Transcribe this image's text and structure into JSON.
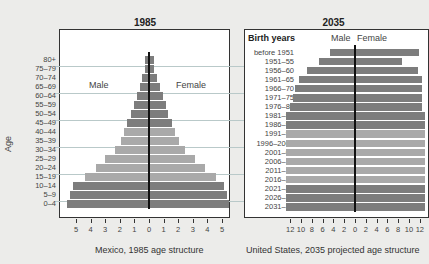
{
  "chart_data": [
    {
      "type": "bar",
      "orientation": "horizontal-population-pyramid",
      "title": "1985",
      "caption": "Mexico, 1985 age structure",
      "ylabel": "Age",
      "xlabel": "",
      "left_label": "Male",
      "right_label": "Female",
      "xlim": [
        -5.6,
        5.6
      ],
      "xticks": [
        5,
        4,
        3,
        2,
        1,
        0,
        1,
        2,
        3,
        4,
        5
      ],
      "categories": [
        "80+",
        "75–79",
        "70–74",
        "65–69",
        "60–64",
        "55–59",
        "50–54",
        "45–49",
        "40–44",
        "35–39",
        "30–34",
        "25–29",
        "20–24",
        "15–19",
        "10–14",
        "5–9",
        "0–4"
      ],
      "series": [
        {
          "name": "Male",
          "values": [
            0.3,
            0.3,
            0.5,
            0.6,
            0.8,
            1.0,
            1.2,
            1.5,
            1.7,
            1.9,
            2.3,
            3.0,
            3.6,
            4.4,
            5.2,
            5.4,
            5.6
          ]
        },
        {
          "name": "Female",
          "values": [
            0.3,
            0.3,
            0.5,
            0.7,
            0.9,
            1.1,
            1.2,
            1.5,
            1.7,
            2.0,
            2.4,
            3.1,
            3.8,
            4.5,
            5.1,
            5.3,
            5.4
          ]
        }
      ],
      "grid": true
    },
    {
      "type": "bar",
      "orientation": "horizontal-population-pyramid",
      "title": "2035",
      "caption": "United States, 2035 projected age structure",
      "ylabel": "Birth years",
      "xlabel": "",
      "left_label": "Male",
      "right_label": "Female",
      "xlim": [
        -12.5,
        12.5
      ],
      "xticks": [
        12,
        10,
        8,
        6,
        4,
        2,
        0,
        2,
        4,
        6,
        8,
        10,
        12
      ],
      "categories": [
        "before 1951",
        "1951–55",
        "1956–60",
        "1961–65",
        "1966–70",
        "1971–75",
        "1976–80",
        "1981–85",
        "1986–90",
        "1991–95",
        "1996–2000",
        "2001–05",
        "2006–10",
        "2011–15",
        "2016–20",
        "2021–25",
        "2026–30",
        "2031–35"
      ],
      "series": [
        {
          "name": "Male",
          "values": [
            4.6,
            6.6,
            8.8,
            10.3,
            11.2,
            11.4,
            12.0,
            12.8,
            14.0,
            14.2,
            14.0,
            14.1,
            14.3,
            14.8,
            15.0,
            15.2,
            15.3,
            15.3
          ]
        },
        {
          "name": "Female",
          "values": [
            11.7,
            8.6,
            11.4,
            12.2,
            12.3,
            12.3,
            12.2,
            12.9,
            14.0,
            14.0,
            13.7,
            14.1,
            14.2,
            14.3,
            14.3,
            14.5,
            14.6,
            14.6
          ]
        }
      ],
      "grid": true
    }
  ],
  "colors": {
    "dark_bar": "#7d7d7d",
    "light_bar": "#a9a9a9",
    "background": "#ececea",
    "grid": "#b9c9c9"
  }
}
